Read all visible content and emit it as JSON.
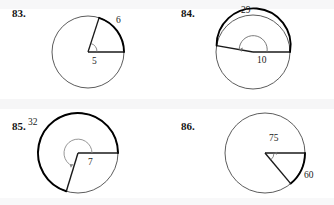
{
  "page": {
    "background_color": "#ffffff",
    "ink_color": "#1a1a1a",
    "bold_arc_color": "#000000",
    "thin_stroke_color": "#4a4a4a",
    "angle_marker_color": "#6b6b6b"
  },
  "problems": [
    {
      "number": "83.",
      "circle": {
        "cx": 88,
        "cy": 52,
        "r": 36
      },
      "arc_label": "6",
      "radius_label": "5",
      "arc_label_pos": {
        "x": 116,
        "y": 21
      },
      "radius_label_pos": {
        "x": 92,
        "y": 63
      },
      "start_angle_deg": 0,
      "end_angle_deg": 72,
      "angle_type": "acute",
      "angle_marker_radius": 9
    },
    {
      "number": "84.",
      "circle": {
        "cx": 86,
        "cy": 52,
        "r": 37
      },
      "arc_label": "29",
      "radius_label": "10",
      "arc_label_pos": {
        "x": 76,
        "y": 10
      },
      "radius_label_pos": {
        "x": 88,
        "y": 58
      },
      "start_angle_deg": 0,
      "end_angle_deg": 190,
      "angle_type": "reflex-over-top",
      "angle_marker_radius": 14
    },
    {
      "number": "85.",
      "circle": {
        "cx": 78,
        "cy": 50,
        "r": 40
      },
      "arc_label": "32",
      "radius_label": "7",
      "arc_label_pos": {
        "x": 30,
        "y": 20
      },
      "radius_label_pos": {
        "x": 88,
        "y": 58
      },
      "start_angle_deg": 0,
      "end_angle_deg": 287,
      "angle_type": "reflex",
      "angle_marker_radius": 14
    },
    {
      "number": "86.",
      "circle": {
        "cx": 98,
        "cy": 50,
        "r": 40
      },
      "arc_label": "60",
      "radius_label": "75",
      "arc_label_pos": {
        "x": 139,
        "y": 72
      },
      "radius_label_pos": {
        "x": 104,
        "y": 35
      },
      "start_angle_deg": 0,
      "end_angle_deg": -50,
      "angle_type": "acute",
      "angle_marker_radius": 9
    }
  ]
}
